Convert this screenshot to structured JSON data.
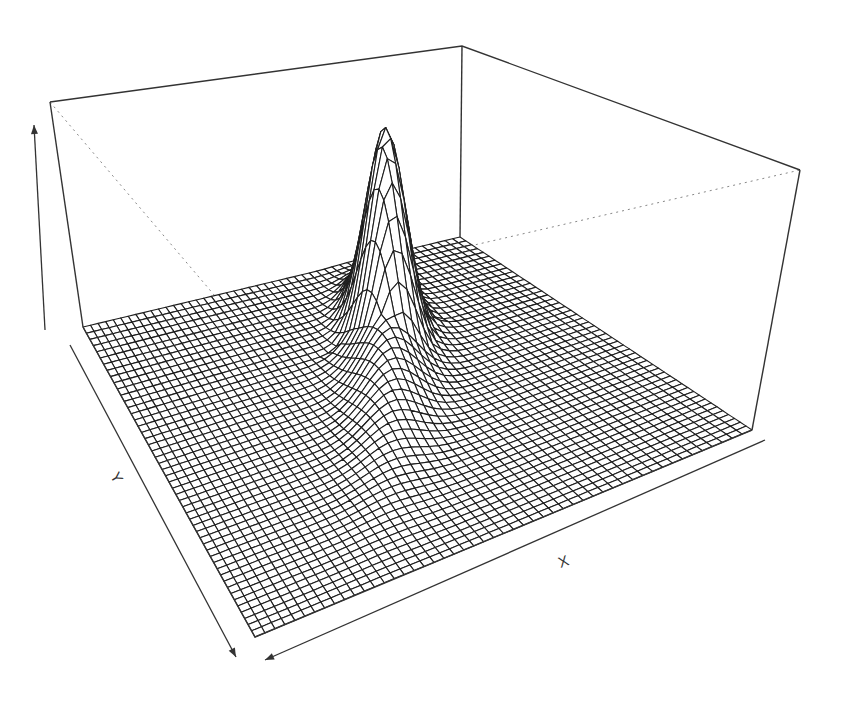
{
  "chart_data": {
    "type": "surface3d",
    "title": "",
    "xlabel": "X",
    "ylabel": "Y",
    "zlabel": "",
    "grid_resolution": [
      50,
      50
    ],
    "function_description": "skewed unimodal peak (bivariate density-like surface) rising sharply near the back-center of the domain, flat elsewhere",
    "x_range": [
      0,
      1
    ],
    "y_range": [
      0,
      1
    ],
    "z_range": [
      0,
      1
    ],
    "peak": {
      "x": 0.62,
      "y": 0.28,
      "z": 1.0
    },
    "render": {
      "style": "wireframe",
      "line_color": "#222222",
      "box": true,
      "hidden_box_lines": "dotted"
    }
  },
  "axes": {
    "x_label": "X",
    "y_label": "Y",
    "z_label": ""
  },
  "colors": {
    "background": "#ffffff",
    "mesh": "#1e1e1e",
    "box": "#333333",
    "hidden": "#888888"
  }
}
